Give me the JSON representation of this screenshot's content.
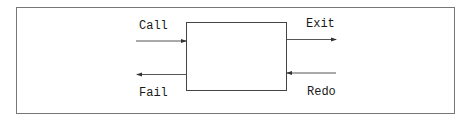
{
  "diagram": {
    "type": "box-port-model",
    "box": {
      "label": ""
    },
    "ports": {
      "call": {
        "label": "Call",
        "direction": "in",
        "side": "left"
      },
      "fail": {
        "label": "Fail",
        "direction": "out",
        "side": "left"
      },
      "exit": {
        "label": "Exit",
        "direction": "out",
        "side": "right"
      },
      "redo": {
        "label": "Redo",
        "direction": "in",
        "side": "right"
      }
    },
    "colors": {
      "stroke": "#444444",
      "text": "#1a1a1a",
      "frame": "#777777"
    }
  }
}
